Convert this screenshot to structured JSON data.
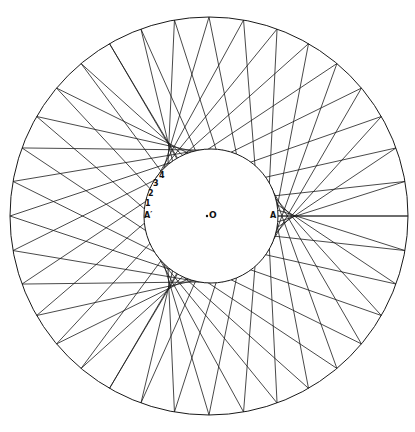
{
  "figure": {
    "type": "envelope-construction",
    "stroke_color": "#1a1a1a",
    "background": "#ffffff",
    "outer_circle": {
      "cx": 209,
      "cy": 216,
      "r": 199
    },
    "inner_circle": {
      "cx": 211,
      "cy": 216,
      "r": 67
    },
    "line_count": 72,
    "outer_angle_multiplier": -2
  },
  "labels": {
    "center": "O",
    "point_a": "A",
    "point_a_prime": "A′",
    "n1": "1",
    "n2": "2",
    "n3": "3",
    "n4": "4"
  }
}
